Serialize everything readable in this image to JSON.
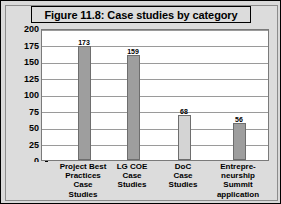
{
  "figure": {
    "title": "Figure 11.8: Case studies by category",
    "border_color": "#000000",
    "panel_color": "#dcdcdc",
    "plot_bg": "#ffffff"
  },
  "chart_data": {
    "type": "bar",
    "title": "Figure 11.8: Case studies by category",
    "xlabel": "",
    "ylabel": "",
    "ylim": [
      0,
      200
    ],
    "yticks": [
      0,
      25,
      50,
      75,
      100,
      125,
      150,
      175,
      200
    ],
    "ytick_labels": [
      "0",
      "25",
      "50",
      "75",
      "100",
      "125",
      "150",
      "175",
      "200"
    ],
    "grid": true,
    "legend": false,
    "categories": [
      "Project Best Practices Case Studies",
      "LG COE Case Studies",
      "DoC Case Studies",
      "Entrepre-neurship Summit application"
    ],
    "category_lines": [
      [
        "Project Best",
        "Practices",
        "Case",
        "Studies"
      ],
      [
        "LG COE",
        "Case",
        "Studies"
      ],
      [
        "DoC",
        "Case",
        "Studies"
      ],
      [
        "Entrepre-",
        "neurship",
        "Summit",
        "application"
      ]
    ],
    "values": [
      173,
      159,
      68,
      56
    ],
    "value_labels": [
      "173",
      "159",
      "68",
      "56"
    ],
    "bar_colors": [
      "#9e9e9e",
      "#9e9e9e",
      "#d4d4d4",
      "#9e9e9e"
    ]
  }
}
